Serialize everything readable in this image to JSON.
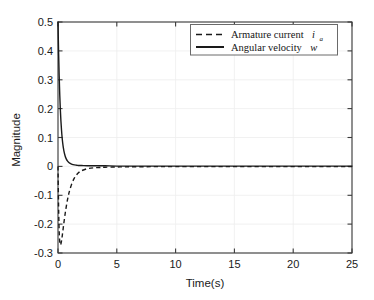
{
  "chart_data": {
    "type": "line",
    "title": "",
    "xlabel": "Time(s)",
    "ylabel": "Magnitude",
    "xlim": [
      0,
      25
    ],
    "ylim": [
      -0.3,
      0.5
    ],
    "xticks": [
      0,
      5,
      10,
      15,
      20,
      25
    ],
    "xtick_labels": [
      "0",
      "5",
      "10",
      "15",
      "20",
      "25"
    ],
    "yticks": [
      -0.3,
      -0.2,
      -0.1,
      0,
      0.1,
      0.2,
      0.3,
      0.4,
      0.5
    ],
    "ytick_labels": [
      "-0.3",
      "-0.2",
      "-0.1",
      "0",
      "0.1",
      "0.2",
      "0.3",
      "0.4",
      "0.5"
    ],
    "grid": true,
    "legend_position": "upper right",
    "series": [
      {
        "name": "Armature current",
        "symbol": "i",
        "subscript": "a",
        "style": "dashed",
        "color": "#1a1a1a",
        "x": [
          0,
          0.05,
          0.1,
          0.15,
          0.2,
          0.25,
          0.3,
          0.35,
          0.4,
          0.45,
          0.5,
          0.6,
          0.7,
          0.8,
          0.9,
          1.0,
          1.2,
          1.4,
          1.6,
          1.8,
          2.0,
          2.5,
          3.0,
          3.5,
          4.0,
          5.0,
          6.0,
          8.0,
          10.0,
          12.5,
          15.0,
          17.5,
          20.0,
          22.5,
          25.0
        ],
        "y": [
          0.0,
          -0.14,
          -0.225,
          -0.262,
          -0.272,
          -0.268,
          -0.258,
          -0.244,
          -0.228,
          -0.212,
          -0.196,
          -0.166,
          -0.14,
          -0.117,
          -0.098,
          -0.082,
          -0.057,
          -0.04,
          -0.028,
          -0.02,
          -0.015,
          -0.008,
          -0.005,
          -0.004,
          -0.003,
          -0.002,
          -0.0015,
          -0.001,
          -0.001,
          -0.001,
          -0.001,
          -0.001,
          -0.001,
          -0.001,
          -0.001
        ]
      },
      {
        "name": "Angular velocity",
        "symbol": "w",
        "subscript": "",
        "style": "solid",
        "color": "#1a1a1a",
        "x": [
          0,
          0.05,
          0.1,
          0.15,
          0.2,
          0.25,
          0.3,
          0.35,
          0.4,
          0.45,
          0.5,
          0.6,
          0.7,
          0.8,
          0.9,
          1.0,
          1.2,
          1.4,
          1.6,
          1.8,
          2.0,
          2.5,
          3.0,
          3.5,
          4.0,
          5.0,
          6.0,
          8.0,
          10.0,
          12.5,
          15.0,
          17.5,
          20.0,
          22.5,
          25.0
        ],
        "y": [
          0.5,
          0.395,
          0.312,
          0.247,
          0.196,
          0.156,
          0.125,
          0.1,
          0.081,
          0.066,
          0.054,
          0.037,
          0.026,
          0.019,
          0.014,
          0.011,
          0.007,
          0.005,
          0.004,
          0.003,
          0.003,
          0.002,
          0.002,
          0.002,
          0.002,
          0.001,
          0.001,
          0.001,
          0.001,
          0.001,
          0.001,
          0.001,
          0.001,
          0.001,
          0.001
        ]
      }
    ]
  },
  "legend": {
    "entries": [
      {
        "prefix": "Armature current",
        "symbol": "i",
        "sub": "a",
        "style": "dashed"
      },
      {
        "prefix": "Angular velocity",
        "symbol": "w",
        "sub": "",
        "style": "solid"
      }
    ]
  },
  "colors": {
    "axis": "#3a3a3a",
    "grid": "#ededed",
    "line": "#1a1a1a",
    "text": "#1a1a1a",
    "background": "#ffffff",
    "legend_border": "#6a6a6a"
  }
}
